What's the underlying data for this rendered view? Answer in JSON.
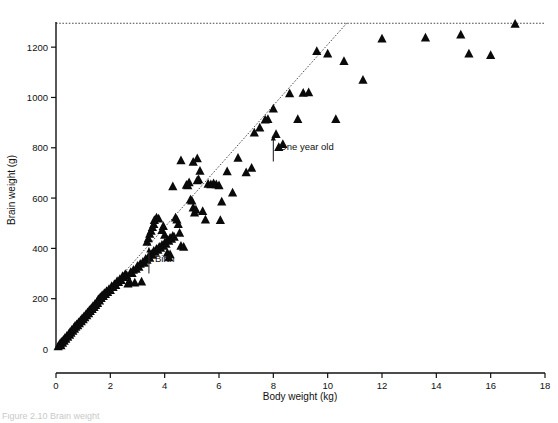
{
  "figure": {
    "caption_partial": "Figure 2.10   Brain weight",
    "background_color": "#ffffff",
    "marker_color": "#0a0a0a",
    "line_color": "#3a3a3a"
  },
  "chart_data": {
    "type": "scatter",
    "title": "",
    "xlabel": "Body weight (kg)",
    "ylabel": "Brain weight (g)",
    "xlim": [
      0,
      18
    ],
    "ylim": [
      0,
      1300
    ],
    "xticks": [
      0,
      2,
      4,
      6,
      8,
      10,
      12,
      14,
      16,
      18
    ],
    "yticks": [
      0,
      200,
      400,
      600,
      800,
      1000,
      1200
    ],
    "xtick_labels": [
      "0",
      "2",
      "4",
      "6",
      "8",
      "10",
      "12",
      "14",
      "16",
      "18"
    ],
    "ytick_labels": [
      "0",
      "200",
      "400",
      "600",
      "800",
      "1000",
      "1200"
    ],
    "grid": false,
    "legend": "none",
    "marker_shape": "triangle-up",
    "series": [
      {
        "name": "Brain weight vs body weight",
        "points": [
          [
            0.08,
            8
          ],
          [
            0.12,
            14
          ],
          [
            0.15,
            20
          ],
          [
            0.18,
            12
          ],
          [
            0.2,
            26
          ],
          [
            0.24,
            22
          ],
          [
            0.27,
            34
          ],
          [
            0.3,
            30
          ],
          [
            0.33,
            42
          ],
          [
            0.36,
            38
          ],
          [
            0.4,
            50
          ],
          [
            0.43,
            46
          ],
          [
            0.47,
            58
          ],
          [
            0.5,
            54
          ],
          [
            0.52,
            66
          ],
          [
            0.55,
            62
          ],
          [
            0.58,
            74
          ],
          [
            0.62,
            70
          ],
          [
            0.65,
            82
          ],
          [
            0.68,
            78
          ],
          [
            0.7,
            90
          ],
          [
            0.73,
            86
          ],
          [
            0.76,
            96
          ],
          [
            0.8,
            92
          ],
          [
            0.83,
            104
          ],
          [
            0.86,
            100
          ],
          [
            0.9,
            112
          ],
          [
            0.93,
            108
          ],
          [
            0.96,
            120
          ],
          [
            1.0,
            116
          ],
          [
            1.03,
            128
          ],
          [
            1.06,
            124
          ],
          [
            1.1,
            136
          ],
          [
            1.13,
            132
          ],
          [
            1.16,
            144
          ],
          [
            1.2,
            140
          ],
          [
            1.23,
            152
          ],
          [
            1.26,
            148
          ],
          [
            1.3,
            160
          ],
          [
            1.33,
            156
          ],
          [
            1.36,
            168
          ],
          [
            1.4,
            164
          ],
          [
            1.43,
            176
          ],
          [
            1.46,
            172
          ],
          [
            1.5,
            184
          ],
          [
            1.53,
            180
          ],
          [
            1.56,
            196
          ],
          [
            1.6,
            190
          ],
          [
            1.63,
            204
          ],
          [
            1.66,
            200
          ],
          [
            1.7,
            212
          ],
          [
            1.74,
            208
          ],
          [
            1.78,
            220
          ],
          [
            1.82,
            216
          ],
          [
            1.86,
            228
          ],
          [
            1.9,
            224
          ],
          [
            1.95,
            236
          ],
          [
            2.0,
            232
          ],
          [
            2.05,
            248
          ],
          [
            2.1,
            244
          ],
          [
            2.15,
            256
          ],
          [
            2.2,
            252
          ],
          [
            2.25,
            268
          ],
          [
            2.3,
            264
          ],
          [
            2.35,
            276
          ],
          [
            2.4,
            272
          ],
          [
            2.45,
            288
          ],
          [
            2.5,
            284
          ],
          [
            2.55,
            296
          ],
          [
            2.6,
            292
          ],
          [
            2.65,
            258
          ],
          [
            2.7,
            268
          ],
          [
            2.75,
            304
          ],
          [
            2.8,
            300
          ],
          [
            2.85,
            312
          ],
          [
            2.9,
            262
          ],
          [
            2.95,
            316
          ],
          [
            3.0,
            328
          ],
          [
            3.05,
            324
          ],
          [
            3.1,
            336
          ],
          [
            3.15,
            266
          ],
          [
            3.2,
            344
          ],
          [
            3.25,
            340
          ],
          [
            3.3,
            356
          ],
          [
            3.35,
            352
          ],
          [
            3.4,
            364
          ],
          [
            3.45,
            360
          ],
          [
            3.5,
            376
          ],
          [
            3.55,
            372
          ],
          [
            3.6,
            388
          ],
          [
            3.65,
            384
          ],
          [
            3.7,
            396
          ],
          [
            3.75,
            392
          ],
          [
            3.8,
            404
          ],
          [
            3.85,
            400
          ],
          [
            3.9,
            412
          ],
          [
            3.95,
            408
          ],
          [
            4.0,
            420
          ],
          [
            4.05,
            416
          ],
          [
            4.1,
            432
          ],
          [
            4.15,
            428
          ],
          [
            4.2,
            440
          ],
          [
            4.25,
            436
          ],
          [
            4.3,
            448
          ],
          [
            4.35,
            444
          ],
          [
            3.35,
            424
          ],
          [
            3.4,
            438
          ],
          [
            3.45,
            456
          ],
          [
            3.5,
            468
          ],
          [
            3.55,
            482
          ],
          [
            3.6,
            494
          ],
          [
            3.62,
            510
          ],
          [
            3.7,
            520
          ],
          [
            3.78,
            516
          ],
          [
            3.9,
            470
          ],
          [
            3.95,
            486
          ],
          [
            4.0,
            452
          ],
          [
            4.1,
            380
          ],
          [
            4.15,
            362
          ],
          [
            4.2,
            374
          ],
          [
            4.4,
            520
          ],
          [
            4.45,
            512
          ],
          [
            4.5,
            494
          ],
          [
            4.55,
            460
          ],
          [
            4.6,
            408
          ],
          [
            4.7,
            404
          ],
          [
            4.8,
            650
          ],
          [
            4.85,
            648
          ],
          [
            4.9,
            660
          ],
          [
            4.95,
            592
          ],
          [
            5.0,
            588
          ],
          [
            5.05,
            560
          ],
          [
            5.1,
            540
          ],
          [
            5.15,
            552
          ],
          [
            5.2,
            668
          ],
          [
            5.25,
            672
          ],
          [
            5.3,
            706
          ],
          [
            5.4,
            546
          ],
          [
            5.5,
            512
          ],
          [
            5.6,
            654
          ],
          [
            5.7,
            652
          ],
          [
            5.8,
            656
          ],
          [
            5.9,
            652
          ],
          [
            6.0,
            648
          ],
          [
            6.05,
            510
          ],
          [
            6.1,
            584
          ],
          [
            6.3,
            704
          ],
          [
            6.5,
            620
          ],
          [
            4.3,
            644
          ],
          [
            4.6,
            748
          ],
          [
            5.05,
            742
          ],
          [
            5.2,
            756
          ],
          [
            6.7,
            758
          ],
          [
            7.0,
            700
          ],
          [
            7.2,
            718
          ],
          [
            7.3,
            858
          ],
          [
            7.5,
            878
          ],
          [
            7.7,
            910
          ],
          [
            7.8,
            912
          ],
          [
            8.0,
            954
          ],
          [
            8.1,
            852
          ],
          [
            8.2,
            800
          ],
          [
            8.35,
            812
          ],
          [
            8.6,
            1014
          ],
          [
            8.9,
            912
          ],
          [
            9.1,
            1016
          ],
          [
            9.3,
            1018
          ],
          [
            9.6,
            1182
          ],
          [
            10.0,
            1172
          ],
          [
            10.3,
            912
          ],
          [
            10.6,
            1142
          ],
          [
            11.3,
            1068
          ],
          [
            12.0,
            1232
          ],
          [
            13.6,
            1236
          ],
          [
            14.9,
            1248
          ],
          [
            15.2,
            1172
          ],
          [
            16.0,
            1166
          ],
          [
            16.9,
            1290
          ]
        ]
      }
    ],
    "fit_line": {
      "style": "dotted",
      "from": [
        0,
        0
      ],
      "to": [
        10.7,
        1295
      ]
    },
    "asymptote": {
      "style": "dotted",
      "y": 1295,
      "from_x": 0,
      "to_x": 18
    },
    "annotations": [
      {
        "label": "Birth",
        "x": 3.42,
        "y": 300,
        "arrow": "up"
      },
      {
        "label": "One year old",
        "x": 8.0,
        "y": 745,
        "arrow": "up"
      }
    ]
  }
}
